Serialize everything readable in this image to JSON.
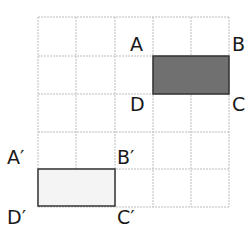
{
  "diagram": {
    "grid": {
      "cols": 5,
      "rows": 5,
      "line_color": "#bdbdbd"
    },
    "shapes": {
      "original": {
        "name": "ABCD",
        "fill": "#707070",
        "stroke": "#333333",
        "cells": {
          "col_start": 3,
          "row_start": 1,
          "width": 2,
          "height": 1
        }
      },
      "image": {
        "name": "A'B'C'D'",
        "fill": "#f4f4f4",
        "stroke": "#333333",
        "cells": {
          "col_start": 0,
          "row_start": 4,
          "width": 2,
          "height": 1
        }
      }
    },
    "labels": {
      "A": "A",
      "B": "B",
      "C": "C",
      "D": "D",
      "A_prime": "A′",
      "B_prime": "B′",
      "C_prime": "C′",
      "D_prime": "D′"
    }
  }
}
